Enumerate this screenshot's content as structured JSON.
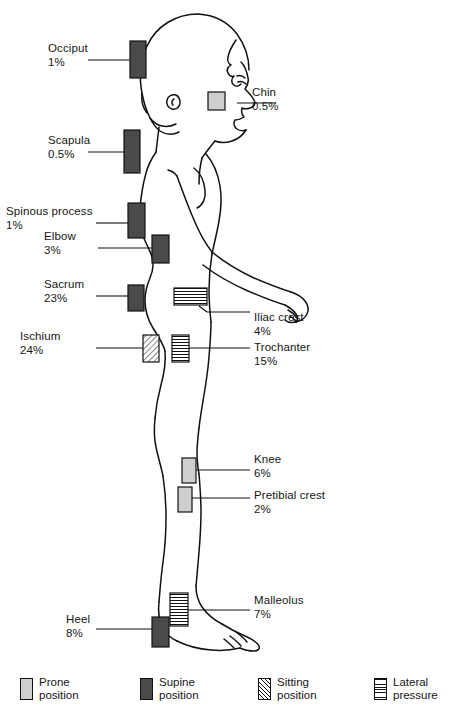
{
  "figure": {
    "orientation": "right-facing lateral view"
  },
  "markers": [
    {
      "key": "occiput",
      "label": "Occiput",
      "value": "1%",
      "style": "supine",
      "side": "left"
    },
    {
      "key": "chin",
      "label": "Chin",
      "value": "0.5%",
      "style": "prone",
      "side": "right"
    },
    {
      "key": "scapula",
      "label": "Scapula",
      "value": "0.5%",
      "style": "supine",
      "side": "left"
    },
    {
      "key": "spinous-process",
      "label": "Spinous process",
      "value": "1%",
      "style": "supine",
      "side": "left"
    },
    {
      "key": "elbow",
      "label": "Elbow",
      "value": "3%",
      "style": "supine",
      "side": "left"
    },
    {
      "key": "sacrum",
      "label": "Sacrum",
      "value": "23%",
      "style": "supine",
      "side": "left"
    },
    {
      "key": "iliac-crest",
      "label": "Iliac crest",
      "value": "4%",
      "style": "lateral",
      "side": "right"
    },
    {
      "key": "ischium",
      "label": "Ischium",
      "value": "24%",
      "style": "sitting",
      "side": "left"
    },
    {
      "key": "trochanter",
      "label": "Trochanter",
      "value": "15%",
      "style": "lateral",
      "side": "right"
    },
    {
      "key": "knee",
      "label": "Knee",
      "value": "6%",
      "style": "prone",
      "side": "right"
    },
    {
      "key": "pretibial-crest",
      "label": "Pretibial crest",
      "value": "2%",
      "style": "prone",
      "side": "right"
    },
    {
      "key": "malleolus",
      "label": "Malleolus",
      "value": "7%",
      "style": "lateral",
      "side": "right"
    },
    {
      "key": "heel",
      "label": "Heel",
      "value": "8%",
      "style": "supine",
      "side": "left"
    }
  ],
  "legend": {
    "items": [
      {
        "key": "prone",
        "line1": "Prone",
        "line2": "position",
        "swatch": "prone"
      },
      {
        "key": "supine",
        "line1": "Supine",
        "line2": "position",
        "swatch": "supine"
      },
      {
        "key": "sitting",
        "line1": "Sitting",
        "line2": "position",
        "swatch": "sitting"
      },
      {
        "key": "lateral",
        "line1": "Lateral",
        "line2": "pressure",
        "swatch": "lateral"
      }
    ]
  },
  "colors": {
    "prone": "#cfcfcf",
    "supine": "#4a4a4a",
    "outline": "#111111",
    "background": "#ffffff"
  }
}
